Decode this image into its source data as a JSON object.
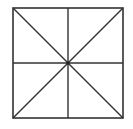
{
  "diagram": {
    "type": "square-with-diagonals-and-midlines",
    "stroke_color": "#333333",
    "background": "#ffffff",
    "square": {
      "x": 13,
      "y": 8,
      "width": 110,
      "height": 110
    },
    "center": {
      "x": 68,
      "y": 63
    },
    "lines": [
      {
        "name": "diagonal-tl-br",
        "x1": 13,
        "y1": 8,
        "x2": 123,
        "y2": 118
      },
      {
        "name": "diagonal-tr-bl",
        "x1": 123,
        "y1": 8,
        "x2": 13,
        "y2": 118
      },
      {
        "name": "vertical-midline",
        "x1": 68,
        "y1": 8,
        "x2": 68,
        "y2": 118
      },
      {
        "name": "horizontal-midline",
        "x1": 13,
        "y1": 63,
        "x2": 123,
        "y2": 63
      }
    ]
  }
}
